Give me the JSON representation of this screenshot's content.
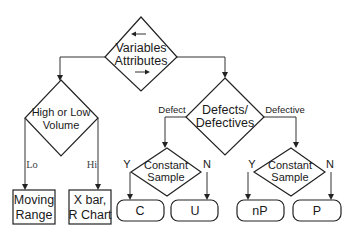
{
  "diagram": {
    "root": {
      "line1": "Variables",
      "line2": "Attributes"
    },
    "volume_decision": {
      "line1": "High or Low",
      "line2": "Volume"
    },
    "volume_branches": {
      "lo": "Lo",
      "hi": "Hi"
    },
    "moving_range": {
      "line1": "Moving",
      "line2": "Range"
    },
    "xbar_chart": {
      "line1": "X bar,",
      "line2": "R Chart"
    },
    "defect_decision": {
      "line1": "Defects/",
      "line2": "Defectives"
    },
    "defect_branches": {
      "left": "Defect",
      "right": "Defective"
    },
    "constant_sample_left": {
      "line1": "Constant",
      "line2": "Sample",
      "yes": "Y",
      "no": "N"
    },
    "constant_sample_right": {
      "line1": "Constant",
      "line2": "Sample",
      "yes": "Y",
      "no": "N"
    },
    "terminals": {
      "c": "C",
      "u": "U",
      "np": "nP",
      "p": "P"
    }
  }
}
